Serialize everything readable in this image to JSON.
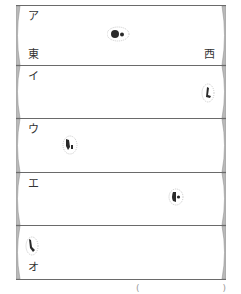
{
  "diagram": {
    "panels": [
      {
        "label": "ア",
        "top": 0,
        "height": 60,
        "blob": {
          "x": 86,
          "y": 17,
          "w": 22,
          "h": 14,
          "shape": "pair"
        }
      },
      {
        "label": "イ",
        "top": 60,
        "height": 53,
        "blob": {
          "x": 182,
          "y": 14,
          "w": 12,
          "h": 18,
          "shape": "tall"
        }
      },
      {
        "label": "ウ",
        "top": 113,
        "height": 54,
        "blob": {
          "x": 45,
          "y": 10,
          "w": 14,
          "h": 18,
          "shape": "tall"
        }
      },
      {
        "label": "エ",
        "top": 167,
        "height": 53,
        "blob": {
          "x": 152,
          "y": 10,
          "w": 14,
          "h": 16,
          "shape": "round"
        }
      },
      {
        "label": "オ",
        "top": 220,
        "height": 53,
        "blob": {
          "x": 9,
          "y": 7,
          "w": 12,
          "h": 18,
          "shape": "tall"
        }
      }
    ],
    "direction_labels": {
      "east": "東",
      "west": "西"
    },
    "footer_marks": {
      "left": "(",
      "right": ")"
    },
    "colors": {
      "edge_fill": "#b9b9b9",
      "line": "#6a6a6a",
      "blob": "#2a2a2a",
      "text": "#333333"
    }
  }
}
